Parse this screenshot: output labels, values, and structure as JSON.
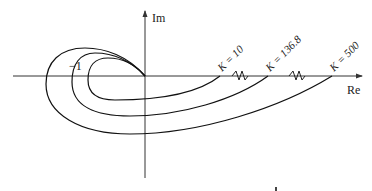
{
  "diagram": {
    "type": "nyquist-plot",
    "axes": {
      "x_label": "Re",
      "y_label": "Im"
    },
    "critical_point_label": "−1",
    "curves": [
      {
        "name": "inner",
        "gain_label": "K = 10"
      },
      {
        "name": "middle",
        "gain_label": "K = 136.8"
      },
      {
        "name": "outer",
        "gain_label": "K = 500"
      }
    ],
    "colors": {
      "line": "#111111",
      "axis": "#333333",
      "background": "#ffffff"
    }
  }
}
